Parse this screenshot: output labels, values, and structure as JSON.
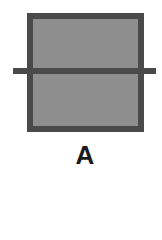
{
  "figure": {
    "label": "A",
    "colors": {
      "border": "#4a4a4a",
      "fill": "#8e8e8e",
      "line": "#4a4a4a",
      "label": "#1a1a1a"
    }
  }
}
